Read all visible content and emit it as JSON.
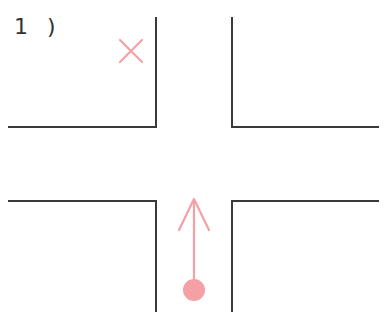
{
  "diagram": {
    "label": "1 )",
    "colors": {
      "road_edge": "#3a3a3a",
      "marker": "#f4a0a4"
    },
    "intersection": {
      "type": "four-way crossroads",
      "left_road_edges_x": 156,
      "right_road_edges_x": 232,
      "top_horizontal_y": 127,
      "bottom_horizontal_y": 201
    },
    "markers": {
      "x_mark": {
        "name": "forbidden-destination",
        "x": 131,
        "y": 51
      },
      "arrow": {
        "name": "straight-ahead-movement",
        "direction": "up",
        "start_dot_y": 289,
        "head_y": 199,
        "x": 194
      }
    }
  }
}
